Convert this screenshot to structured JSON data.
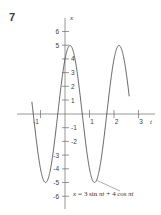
{
  "figure": {
    "problem_number": "7",
    "background_color": "#ffffff",
    "curve_color": "#4a4a4a",
    "axis_color": "#6b6b6b",
    "text_color": "#3d3d3d"
  },
  "annotation": {
    "equation_text": "x = 3 sin πt + 4 cos πt",
    "parts": {
      "lhs": "x",
      "equals": "=",
      "term1_coeff": "3",
      "term1_fn": "sin",
      "term1_arg": "πt",
      "plus": "+",
      "term2_coeff": "4",
      "term2_fn": "cos",
      "term2_arg": "πt"
    },
    "leader_from": "trough near t = 1.25, x = -5",
    "leader_to": "equation label"
  },
  "chart_data": {
    "type": "line",
    "title": "",
    "xlabel": "t",
    "ylabel": "x",
    "grid": false,
    "legend": null,
    "xlim": [
      -1.55,
      3.4
    ],
    "ylim": [
      -6.6,
      6.6
    ],
    "x_ticks": [
      -1,
      1,
      2,
      3
    ],
    "x_tick_labels": [
      "-1",
      "1",
      "2",
      "3"
    ],
    "y_ticks": [
      -6,
      -5,
      -4,
      -3,
      -2,
      -1,
      1,
      2,
      3,
      4,
      5,
      6
    ],
    "y_tick_labels": [
      "-6",
      "-5",
      "-4",
      "-3",
      "-2",
      "-1",
      "1",
      "2",
      "3",
      "4",
      "5",
      "6"
    ],
    "series": [
      {
        "name": "x = 3 sin πt + 4 cos πt",
        "formula": "3*sin(pi*t) + 4*cos(pi*t)",
        "amplitude": 5,
        "period": 2,
        "phase_shift": 0.2951672,
        "t_start": -1.35,
        "t_end": 2.62,
        "key_points": [
          {
            "t": -1.35,
            "x": 2.7
          },
          {
            "t": -1.25,
            "x": 1.55
          },
          {
            "t": -1.0,
            "x": -4.0
          },
          {
            "t": -0.75,
            "x": -4.95
          },
          {
            "t": -0.5,
            "x": -3.0
          },
          {
            "t": -0.25,
            "x": 0.71
          },
          {
            "t": 0.0,
            "x": 4.0
          },
          {
            "t": 0.2,
            "x": 5.0
          },
          {
            "t": 0.25,
            "x": 4.95
          },
          {
            "t": 0.5,
            "x": 3.0
          },
          {
            "t": 0.75,
            "x": -0.71
          },
          {
            "t": 1.0,
            "x": -4.0
          },
          {
            "t": 1.25,
            "x": -5.0
          },
          {
            "t": 1.5,
            "x": -3.0
          },
          {
            "t": 1.75,
            "x": 0.71
          },
          {
            "t": 2.0,
            "x": 4.0
          },
          {
            "t": 2.2,
            "x": 5.0
          },
          {
            "t": 2.5,
            "x": 3.0
          },
          {
            "t": 2.62,
            "x": 1.6
          }
        ]
      }
    ]
  }
}
